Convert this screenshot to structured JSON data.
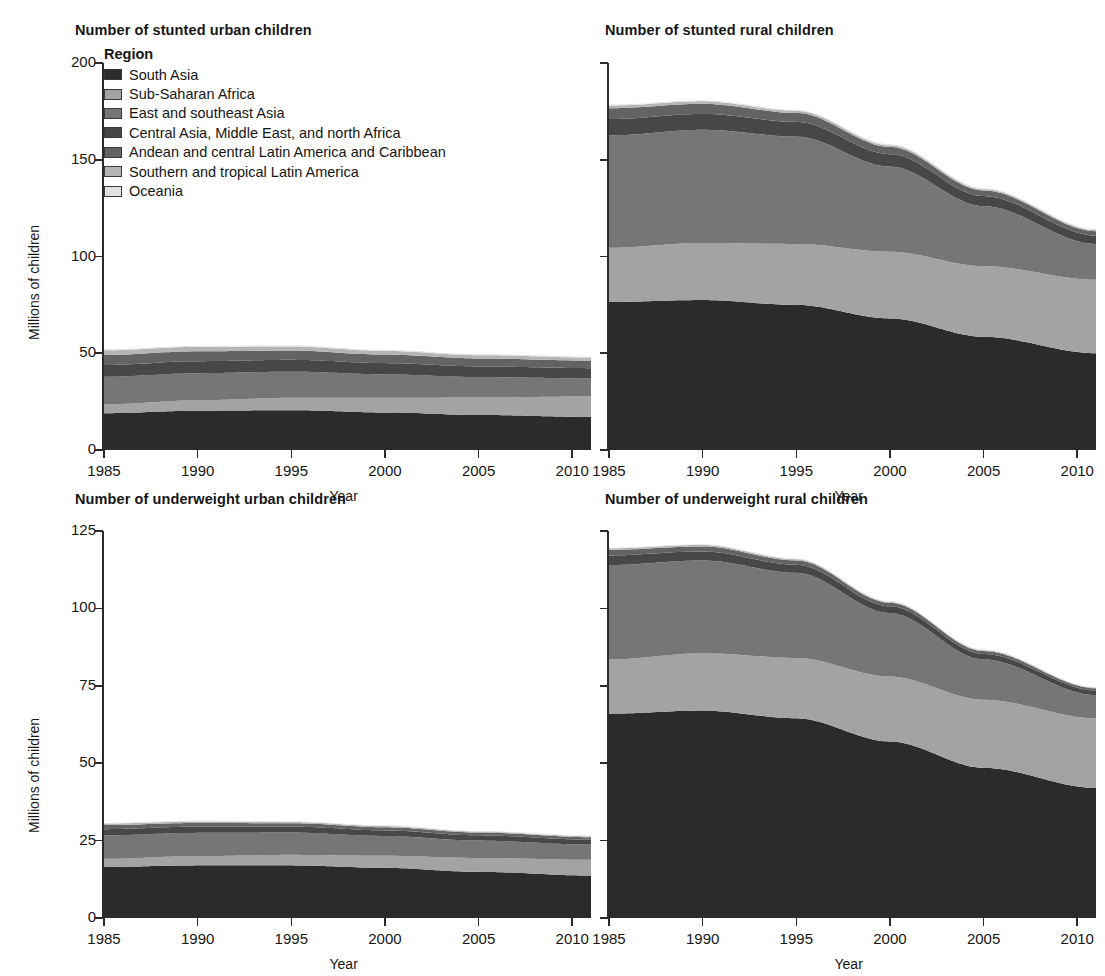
{
  "figure": {
    "ylabel": "Millions of children",
    "xlabel": "Year"
  },
  "legend": {
    "title": "Region",
    "items": [
      {
        "label": "South Asia",
        "color": "#2b2b2b"
      },
      {
        "label": "Sub-Saharan Africa",
        "color": "#a3a3a3"
      },
      {
        "label": "East and southeast Asia",
        "color": "#767676"
      },
      {
        "label": "Central Asia, Middle East, and north Africa",
        "color": "#474747"
      },
      {
        "label": "Andean and central Latin America and Caribbean",
        "color": "#636363"
      },
      {
        "label": "Southern and tropical Latin America",
        "color": "#b5b5b5"
      },
      {
        "label": "Oceania",
        "color": "#e2e2e2"
      }
    ]
  },
  "chart_data": [
    {
      "type": "area",
      "id": "stunted-urban",
      "title": "Number of stunted urban children",
      "xlabel": "Year",
      "ylabel": "Millions of children",
      "stacked": true,
      "grid": false,
      "legend_position": "inside-top-left",
      "xlim": [
        1985,
        2011
      ],
      "ylim": [
        0,
        200
      ],
      "xticks": [
        1985,
        1990,
        1995,
        2000,
        2005,
        2010
      ],
      "yticks": [
        0,
        50,
        100,
        150,
        200
      ],
      "x": [
        1985,
        1990,
        1995,
        2000,
        2005,
        2011
      ],
      "series": [
        {
          "name": "South Asia",
          "values": [
            19.0,
            20.3,
            20.6,
            19.4,
            18.1,
            17.1
          ]
        },
        {
          "name": "Sub-Saharan Africa",
          "values": [
            4.6,
            5.4,
            6.4,
            7.6,
            9.0,
            10.6
          ]
        },
        {
          "name": "East and southeast Asia",
          "values": [
            14.2,
            14.0,
            13.5,
            12.1,
            10.6,
            9.3
          ]
        },
        {
          "name": "Central Asia, Middle East, and north Africa",
          "values": [
            6.1,
            6.2,
            6.1,
            5.8,
            5.5,
            5.3
          ]
        },
        {
          "name": "Andean and central Latin America and Caribbean",
          "values": [
            5.2,
            5.1,
            4.8,
            4.4,
            4.1,
            3.9
          ]
        },
        {
          "name": "Southern and tropical Latin America",
          "values": [
            2.4,
            2.3,
            2.1,
            1.9,
            1.7,
            1.6
          ]
        },
        {
          "name": "Oceania",
          "values": [
            0.5,
            0.5,
            0.5,
            0.5,
            0.5,
            0.5
          ]
        }
      ],
      "totals": [
        52.0,
        53.8,
        54.0,
        51.7,
        49.5,
        48.3
      ]
    },
    {
      "type": "area",
      "id": "stunted-rural",
      "title": "Number of stunted rural children",
      "xlabel": "Year",
      "ylabel": "Millions of children",
      "stacked": true,
      "grid": false,
      "xlim": [
        1985,
        2011
      ],
      "ylim": [
        0,
        200
      ],
      "xticks": [
        1985,
        1990,
        1995,
        2000,
        2005,
        2010
      ],
      "yticks": [
        0,
        50,
        100,
        150,
        200
      ],
      "x": [
        1985,
        1990,
        1995,
        2000,
        2005,
        2011
      ],
      "series": [
        {
          "name": "South Asia",
          "values": [
            76.5,
            77.5,
            75.0,
            68.0,
            58.5,
            50.0
          ]
        },
        {
          "name": "Sub-Saharan Africa",
          "values": [
            28.0,
            29.5,
            31.5,
            34.5,
            36.5,
            38.0
          ]
        },
        {
          "name": "East and southeast Asia",
          "values": [
            58.0,
            58.5,
            55.5,
            44.0,
            31.0,
            18.5
          ]
        },
        {
          "name": "Central Asia, Middle East, and north Africa",
          "values": [
            8.5,
            8.2,
            7.6,
            6.4,
            5.2,
            4.3
          ]
        },
        {
          "name": "Andean and central Latin America and Caribbean",
          "values": [
            5.6,
            5.2,
            4.6,
            3.7,
            2.9,
            2.3
          ]
        },
        {
          "name": "Southern and tropical Latin America",
          "values": [
            1.4,
            1.3,
            1.1,
            0.9,
            0.7,
            0.6
          ]
        },
        {
          "name": "Oceania",
          "values": [
            0.5,
            0.5,
            0.5,
            0.5,
            0.5,
            0.5
          ]
        }
      ],
      "totals": [
        178.5,
        180.7,
        175.8,
        158.0,
        135.3,
        114.2
      ]
    },
    {
      "type": "area",
      "id": "underweight-urban",
      "title": "Number of underweight urban children",
      "xlabel": "Year",
      "ylabel": "Millions of children",
      "stacked": true,
      "grid": false,
      "xlim": [
        1985,
        2011
      ],
      "ylim": [
        0,
        125
      ],
      "xticks": [
        1985,
        1990,
        1995,
        2000,
        2005,
        2010
      ],
      "yticks": [
        0,
        25,
        50,
        75,
        100,
        125
      ],
      "x": [
        1985,
        1990,
        1995,
        2000,
        2005,
        2011
      ],
      "series": [
        {
          "name": "South Asia",
          "values": [
            16.5,
            17.0,
            17.0,
            16.2,
            14.9,
            13.7
          ]
        },
        {
          "name": "Sub-Saharan Africa",
          "values": [
            2.6,
            3.0,
            3.4,
            3.9,
            4.5,
            5.1
          ]
        },
        {
          "name": "East and southeast Asia",
          "values": [
            7.6,
            7.5,
            7.2,
            6.4,
            5.6,
            4.9
          ]
        },
        {
          "name": "Central Asia, Middle East, and north Africa",
          "values": [
            2.0,
            2.0,
            1.9,
            1.8,
            1.7,
            1.6
          ]
        },
        {
          "name": "Andean and central Latin America and Caribbean",
          "values": [
            1.3,
            1.2,
            1.1,
            1.0,
            0.9,
            0.8
          ]
        },
        {
          "name": "Southern and tropical Latin America",
          "values": [
            0.5,
            0.5,
            0.4,
            0.4,
            0.3,
            0.3
          ]
        },
        {
          "name": "Oceania",
          "values": [
            0.2,
            0.2,
            0.2,
            0.2,
            0.2,
            0.2
          ]
        }
      ],
      "totals": [
        30.7,
        31.4,
        31.2,
        29.9,
        28.1,
        26.6
      ]
    },
    {
      "type": "area",
      "id": "underweight-rural",
      "title": "Number of underweight rural children",
      "xlabel": "Year",
      "ylabel": "Millions of children",
      "stacked": true,
      "grid": false,
      "xlim": [
        1985,
        2011
      ],
      "ylim": [
        0,
        125
      ],
      "xticks": [
        1985,
        1990,
        1995,
        2000,
        2005,
        2010
      ],
      "yticks": [
        0,
        25,
        50,
        75,
        100,
        125
      ],
      "x": [
        1985,
        1990,
        1995,
        2000,
        2005,
        2011
      ],
      "series": [
        {
          "name": "South Asia",
          "values": [
            66.0,
            67.0,
            64.5,
            57.0,
            48.5,
            42.0
          ]
        },
        {
          "name": "Sub-Saharan Africa",
          "values": [
            17.5,
            18.5,
            19.5,
            21.0,
            22.0,
            22.5
          ]
        },
        {
          "name": "East and southeast Asia",
          "values": [
            30.5,
            30.0,
            27.5,
            20.5,
            13.0,
            7.5
          ]
        },
        {
          "name": "Central Asia, Middle East, and north Africa",
          "values": [
            3.1,
            2.9,
            2.6,
            2.2,
            1.8,
            1.5
          ]
        },
        {
          "name": "Andean and central Latin America and Caribbean",
          "values": [
            1.8,
            1.6,
            1.4,
            1.1,
            0.9,
            0.7
          ]
        },
        {
          "name": "Southern and tropical Latin America",
          "values": [
            0.5,
            0.5,
            0.4,
            0.3,
            0.3,
            0.2
          ]
        },
        {
          "name": "Oceania",
          "values": [
            0.2,
            0.2,
            0.2,
            0.2,
            0.2,
            0.2
          ]
        }
      ],
      "totals": [
        119.6,
        120.7,
        116.1,
        102.3,
        86.7,
        74.6
      ]
    }
  ]
}
